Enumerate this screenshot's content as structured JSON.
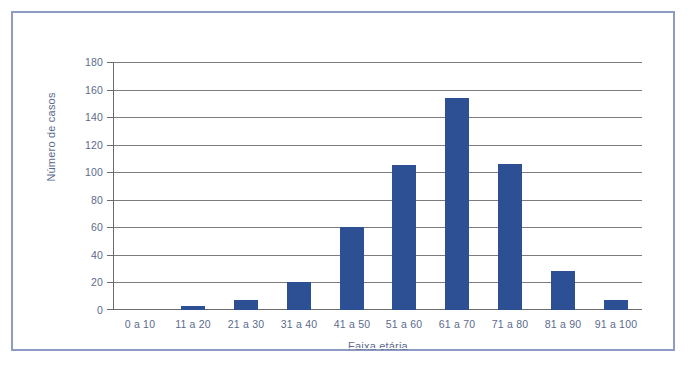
{
  "figure": {
    "caption": ""
  },
  "chart_data": {
    "type": "bar",
    "title": "",
    "xlabel": "Faixa etária",
    "ylabel": "Número de casos",
    "categories": [
      "0 a 10",
      "11 a 20",
      "21 a 30",
      "31 a 40",
      "41 a 50",
      "51 a 60",
      "61 a 70",
      "71 a 80",
      "81 a 90",
      "91 a 100"
    ],
    "values": [
      0,
      3,
      7,
      20,
      60,
      105,
      154,
      106,
      28,
      7
    ],
    "ylim": [
      0,
      180
    ],
    "ytick_step": 20,
    "yticks": [
      0,
      20,
      40,
      60,
      80,
      100,
      120,
      140,
      160,
      180
    ],
    "ytick_labels": [
      "0",
      "20",
      "40",
      "60",
      "80",
      "100",
      "120",
      "140",
      "160",
      "180"
    ],
    "grid": "horizontal",
    "legend": "none",
    "series": [
      {
        "name": "Número de casos",
        "values": [
          0,
          3,
          7,
          20,
          60,
          105,
          154,
          106,
          28,
          7
        ]
      }
    ],
    "colors": {
      "bar": "#2d4f94",
      "gridline": "#7c7c7c",
      "axis": "#6b6b6b",
      "tick_label": "#5b6b8c",
      "axis_title": "#5b6b8c",
      "frame_border": "#8e9cc4",
      "background": "#ffffff"
    }
  }
}
